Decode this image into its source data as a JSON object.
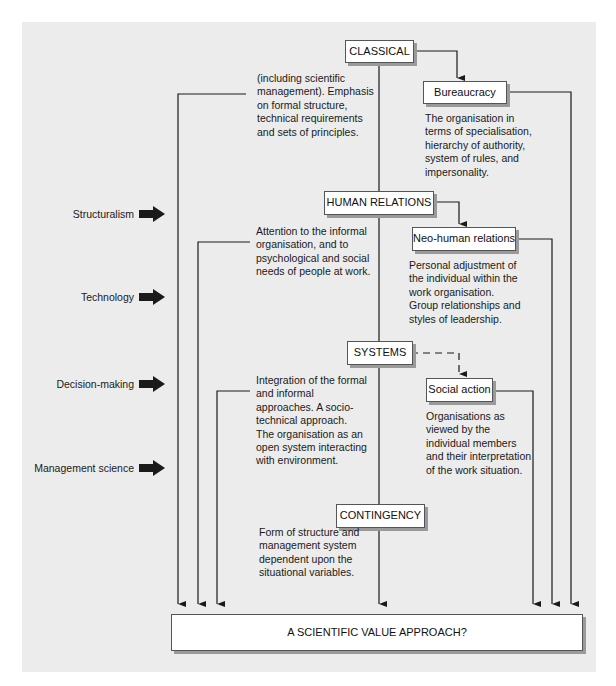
{
  "approaches": {
    "classical": {
      "label": "CLASSICAL",
      "description": [
        "(including scientific",
        "management). Emphasis",
        "on formal structure,",
        "technical requirements",
        "and sets of principles."
      ]
    },
    "bureaucracy": {
      "label": "Bureaucracy",
      "description": [
        "The organisation in",
        "terms of specialisation,",
        "hierarchy of authority,",
        "system of rules, and",
        "impersonality."
      ]
    },
    "human_relations": {
      "label": "HUMAN RELATIONS",
      "description": [
        "Attention to the informal",
        "organisation, and to",
        "psychological and social",
        "needs of people at work."
      ]
    },
    "neo_human_relations": {
      "label": "Neo-human relations",
      "description": [
        "Personal adjustment of",
        "the individual within the",
        "work organisation.",
        "Group relationships and",
        "styles of leadership."
      ]
    },
    "systems": {
      "label": "SYSTEMS",
      "description": [
        "Integration of the formal",
        "and informal",
        "approaches. A  socio-",
        "technical approach.",
        "The organisation as an",
        "open system interacting",
        "with environment."
      ]
    },
    "social_action": {
      "label": "Social action",
      "description": [
        "Organisations as",
        "viewed by the",
        "individual members",
        "and their interpretation",
        "of the work situation."
      ]
    },
    "contingency": {
      "label": "CONTINGENCY",
      "description": [
        "Form of structure and",
        "management system",
        "dependent upon the",
        "situational variables."
      ]
    }
  },
  "influences": [
    {
      "label": "Structuralism",
      "icon": "block-arrow-right-icon"
    },
    {
      "label": "Technology",
      "icon": "block-arrow-right-icon"
    },
    {
      "label": "Decision-making",
      "icon": "block-arrow-right-icon"
    },
    {
      "label": "Management science",
      "icon": "block-arrow-right-icon"
    }
  ],
  "outcome": {
    "label": "A SCIENTIFIC VALUE APPROACH?"
  },
  "colors": {
    "panel_background": "#ececec",
    "box_fill": "#ffffff",
    "line": "#1a1a1a",
    "box_shadow": "#9a9a9a",
    "arrow_fill": "#1a1a1a"
  }
}
